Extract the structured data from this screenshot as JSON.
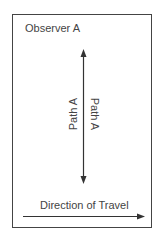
{
  "diagram": {
    "observer_label": "Observer A",
    "path_label_left": "Path A",
    "path_label_right": "Path A",
    "travel_label": "Direction of Travel",
    "colors": {
      "line": "#333333",
      "frame": "#444444",
      "text": "#444444"
    }
  }
}
